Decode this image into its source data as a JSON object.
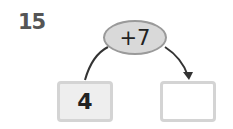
{
  "question": {
    "number": "15"
  },
  "operation": {
    "label": "+7"
  },
  "input_box": {
    "value": "4"
  },
  "output_box": {
    "value": ""
  },
  "colors": {
    "oval_fill": "#d9d9d9",
    "oval_border": "#9a9a9a",
    "box_border": "#d4d4d4",
    "arrow": "#333333"
  }
}
